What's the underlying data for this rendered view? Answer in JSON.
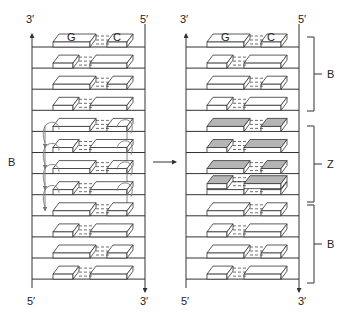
{
  "colors": {
    "line": "#333333",
    "block_fill": "#ffffff",
    "block_shaded": "#b5b5b5",
    "curve": "#777777"
  },
  "left_panel": {
    "top_left_label": "3′",
    "top_right_label": "5′",
    "bottom_left_label": "5′",
    "bottom_right_label": "3′",
    "side_label": "B",
    "first_pair_letters": [
      "G",
      "C"
    ],
    "rows": [
      {
        "left": "L",
        "right": "S",
        "shaded": false
      },
      {
        "left": "S",
        "right": "L",
        "shaded": false
      },
      {
        "left": "L",
        "right": "S",
        "shaded": false
      },
      {
        "left": "S",
        "right": "L",
        "shaded": false
      },
      {
        "left": "L",
        "right": "S",
        "shaded": false,
        "flip": true
      },
      {
        "left": "S",
        "right": "L",
        "shaded": false,
        "flip": true
      },
      {
        "left": "L",
        "right": "S",
        "shaded": false,
        "flip": true
      },
      {
        "left": "S",
        "right": "L",
        "shaded": false,
        "flip": true
      },
      {
        "left": "L",
        "right": "S",
        "shaded": false
      },
      {
        "left": "S",
        "right": "L",
        "shaded": false
      },
      {
        "left": "L",
        "right": "S",
        "shaded": false
      },
      {
        "left": "S",
        "right": "L",
        "shaded": false
      }
    ]
  },
  "transition_arrow": "→",
  "right_panel": {
    "top_left_label": "3′",
    "top_right_label": "5′",
    "bottom_left_label": "5′",
    "bottom_right_label": "3′",
    "first_pair_letters": [
      "G",
      "C"
    ],
    "brackets": [
      {
        "label": "B",
        "from_row": 0,
        "to_row": 3
      },
      {
        "label": "Z",
        "from_row": 4,
        "to_row": 7
      },
      {
        "label": "B",
        "from_row": 8,
        "to_row": 11
      }
    ],
    "rows": [
      {
        "left": "L",
        "right": "S",
        "shaded": false
      },
      {
        "left": "S",
        "right": "L",
        "shaded": false
      },
      {
        "left": "L",
        "right": "S",
        "shaded": false
      },
      {
        "left": "S",
        "right": "L",
        "shaded": false
      },
      {
        "left": "L",
        "right": "S",
        "shaded": true
      },
      {
        "left": "S",
        "right": "L",
        "shaded": true
      },
      {
        "left": "L",
        "right": "S",
        "shaded": true
      },
      {
        "left": "S",
        "right": "L",
        "shaded": true,
        "stacked": true
      },
      {
        "left": "L",
        "right": "S",
        "shaded": false
      },
      {
        "left": "S",
        "right": "L",
        "shaded": false
      },
      {
        "left": "L",
        "right": "S",
        "shaded": false
      },
      {
        "left": "S",
        "right": "L",
        "shaded": false
      }
    ]
  }
}
